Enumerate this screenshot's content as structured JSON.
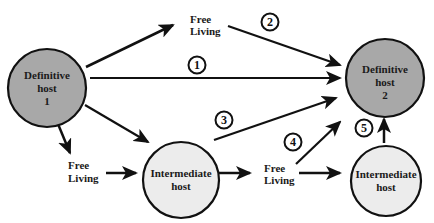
{
  "diagram": {
    "nodes": {
      "definitive_host_1": {
        "line1": "Definitive",
        "line2": "host",
        "line3": "1",
        "fill": "#a8a8a8"
      },
      "definitive_host_2": {
        "line1": "Definitive",
        "line2": "host",
        "line3": "2",
        "fill": "#a8a8a8"
      },
      "intermediate_host_a": {
        "line1": "Intermediate",
        "line2": "host",
        "fill": "#ececec"
      },
      "intermediate_host_b": {
        "line1": "Intermediate",
        "line2": "host",
        "fill": "#ececec"
      }
    },
    "free_living": {
      "top": {
        "line1": "Free",
        "line2": "Living"
      },
      "left": {
        "line1": "Free",
        "line2": "Living"
      },
      "right": {
        "line1": "Free",
        "line2": "Living"
      }
    },
    "route_labels": {
      "r1": "1",
      "r2": "2",
      "r3": "3",
      "r4": "4",
      "r5": "5"
    },
    "colors": {
      "stroke": "#111111",
      "definitive_fill": "#a8a8a8",
      "intermediate_fill": "#ececec"
    }
  }
}
